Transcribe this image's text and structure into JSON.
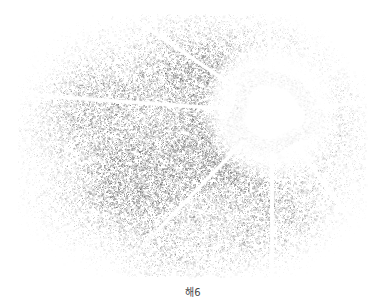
{
  "figure": {
    "caption": "해6",
    "background_color": "#ffffff",
    "width": 386,
    "height": 307
  },
  "plate": {
    "name": "noise-field-plate",
    "left": 0,
    "top": 0,
    "width": 386,
    "height": 282,
    "field_bounds": {
      "x0": 18,
      "y0": 14,
      "x1": 366,
      "y1": 277
    }
  },
  "chart_data": {
    "type": "heatmap",
    "title": "해6",
    "xlabel": "",
    "ylabel": "",
    "colormap": "grayscale-inverted",
    "background": "#ffffff",
    "grid": false,
    "legend": null,
    "value_range": [
      0,
      1
    ],
    "noise_field": {
      "x_range": [
        18,
        366
      ],
      "y_range": [
        14,
        277
      ],
      "mean_density": 0.34,
      "dot_color": "#8d8d8d",
      "falloff": "radial-vignette",
      "density_profile": [
        {
          "region": "center",
          "density": 0.52
        },
        {
          "region": "mid",
          "density": 0.36
        },
        {
          "region": "edge",
          "density": 0.12
        },
        {
          "region": "corner",
          "density": 0.04
        }
      ]
    },
    "bright_source": {
      "name": "saturated-halo",
      "cx": 272,
      "cy": 112,
      "core_radius": 26,
      "ring_inner_radius": 27,
      "ring_outer_radius": 44,
      "halo_radius": 72,
      "core_color": "#ffffff",
      "ring_color": "#d6d6d6",
      "halo_color": "#fafafa"
    },
    "streaks": [
      {
        "name": "streak-up",
        "angle_deg": -92,
        "length": 104,
        "thickness": 2.0,
        "color": "#ffffff"
      },
      {
        "name": "streak-upper-right",
        "angle_deg": -34,
        "length": 118,
        "thickness": 2.2,
        "color": "#ffffff"
      },
      {
        "name": "streak-right",
        "angle_deg": -6,
        "length": 104,
        "thickness": 2.4,
        "color": "#ffffff"
      },
      {
        "name": "streak-lower-right",
        "angle_deg": 54,
        "length": 168,
        "thickness": 2.4,
        "color": "#ffffff"
      },
      {
        "name": "streak-down",
        "angle_deg": 90,
        "length": 168,
        "thickness": 2.6,
        "color": "#ffffff"
      },
      {
        "name": "streak-lower-left",
        "angle_deg": 134,
        "length": 162,
        "thickness": 2.2,
        "color": "#ffffff"
      },
      {
        "name": "streak-left",
        "angle_deg": 184,
        "length": 228,
        "thickness": 2.4,
        "color": "#ffffff"
      },
      {
        "name": "streak-upper-left",
        "angle_deg": -146,
        "length": 196,
        "thickness": 2.2,
        "color": "#ffffff"
      }
    ]
  }
}
